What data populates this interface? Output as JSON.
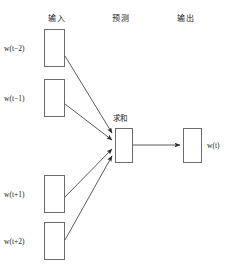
{
  "figure": {
    "headers": [
      {
        "label": "输入",
        "x": 48,
        "y": 12
      },
      {
        "label": "预测",
        "x": 112,
        "y": 12
      },
      {
        "label": "输出",
        "x": 177,
        "y": 12
      }
    ],
    "input_nodes": [
      {
        "label_prefix": "w(",
        "var": "t",
        "suffix": "−2)",
        "full": "w(t−2)",
        "box": {
          "x": 44,
          "y": 29,
          "w": 21,
          "h": 38
        },
        "label_x": 4,
        "label_y": 44
      },
      {
        "label_prefix": "w(",
        "var": "t",
        "suffix": "−1)",
        "full": "w(t−1)",
        "box": {
          "x": 44,
          "y": 79,
          "w": 21,
          "h": 38
        },
        "label_x": 4,
        "label_y": 94
      },
      {
        "label_prefix": "w(",
        "var": "t",
        "suffix": "+1)",
        "full": "w(t+1)",
        "box": {
          "x": 44,
          "y": 175,
          "w": 21,
          "h": 38
        },
        "label_x": 4,
        "label_y": 190
      },
      {
        "label_prefix": "w(",
        "var": "t",
        "suffix": "+2)",
        "full": "w(t+2)",
        "box": {
          "x": 44,
          "y": 222,
          "w": 21,
          "h": 38
        },
        "label_x": 4,
        "label_y": 237
      }
    ],
    "sum_node": {
      "label": "求和",
      "label_x": 113,
      "label_y": 112,
      "box": {
        "x": 115,
        "y": 128,
        "w": 18,
        "h": 35
      }
    },
    "output_node": {
      "label": "w(t)",
      "label_x": 207,
      "label_y": 141,
      "box": {
        "x": 183,
        "y": 128,
        "w": 19,
        "h": 35
      }
    },
    "edges": [
      {
        "name": "edge-input-1-to-sum",
        "x1": 65,
        "y1": 56,
        "x2": 113,
        "y2": 133
      },
      {
        "name": "edge-input-2-to-sum",
        "x1": 65,
        "y1": 104,
        "x2": 113,
        "y2": 140
      },
      {
        "name": "edge-input-3-to-sum",
        "x1": 65,
        "y1": 197,
        "x2": 113,
        "y2": 148
      },
      {
        "name": "edge-input-4-to-sum",
        "x1": 65,
        "y1": 240,
        "x2": 113,
        "y2": 155
      },
      {
        "name": "edge-sum-to-output",
        "x1": 133,
        "y1": 145,
        "x2": 181,
        "y2": 145
      }
    ],
    "colors": {
      "box_stroke": "#6b6b6b",
      "edge_stroke": "#4a4a4a",
      "text": "#1a1a1a",
      "background": "#ffffff"
    }
  }
}
